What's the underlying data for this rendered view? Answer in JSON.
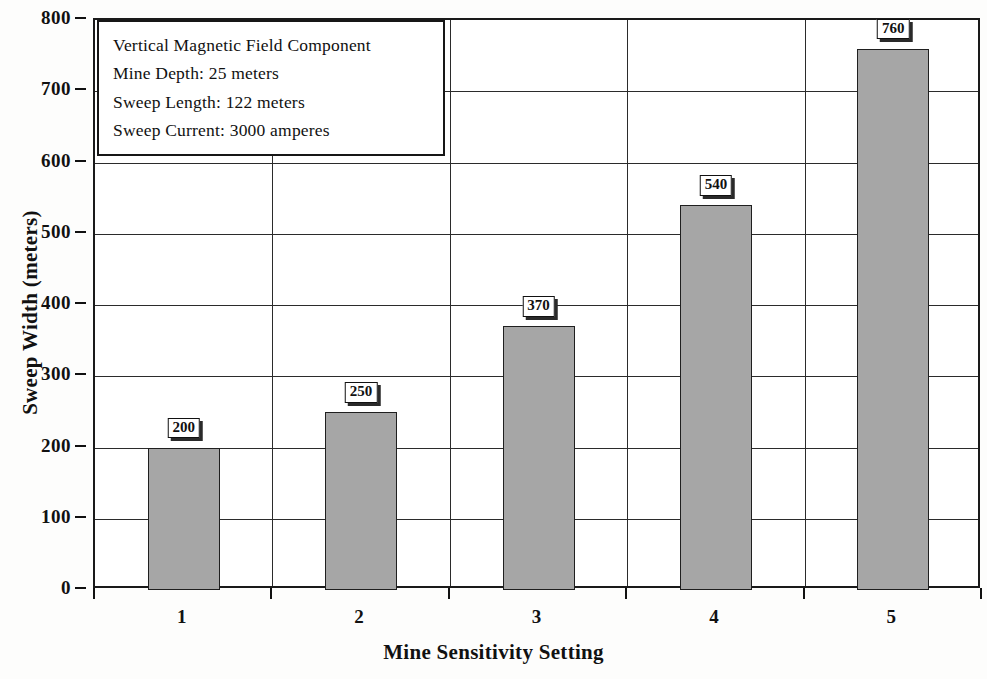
{
  "chart_data": {
    "type": "bar",
    "title": "",
    "xlabel": "Mine Sensitivity Setting",
    "ylabel": "Sweep Width (meters)",
    "categories": [
      "1",
      "2",
      "3",
      "4",
      "5"
    ],
    "values": [
      200,
      250,
      370,
      540,
      760
    ],
    "data_labels": [
      "200",
      "250",
      "370",
      "540",
      "760"
    ],
    "ylim": [
      0,
      800
    ],
    "yticks": [
      0,
      100,
      200,
      300,
      400,
      500,
      600,
      700,
      800
    ],
    "ytick_labels": [
      "0",
      "100",
      "200",
      "300",
      "400",
      "500",
      "600",
      "700",
      "800"
    ],
    "grid": "both",
    "legend": "none",
    "bar_color": "#a6a6a6",
    "bar_edge_color": "#1f1f1f",
    "annotations": [
      "Vertical Magnetic Field Component",
      "Mine Depth: 25 meters",
      "Sweep Length: 122 meters",
      "Sweep Current: 3000 amperes"
    ]
  },
  "annotation_box": {
    "lines": [
      "Vertical Magnetic Field Component",
      "Mine Depth: 25 meters",
      "Sweep Length: 122 meters",
      "Sweep Current: 3000 amperes"
    ]
  }
}
